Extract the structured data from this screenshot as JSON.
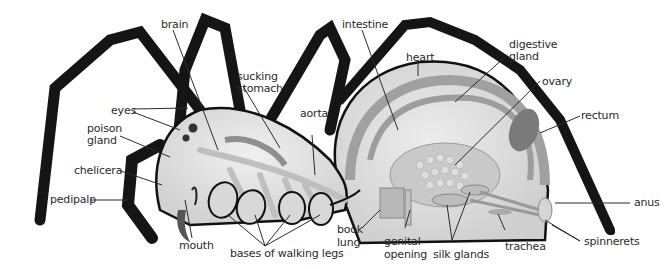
{
  "diagram": {
    "labels": {
      "brain": "brain",
      "sucking_1": "sucking",
      "sucking_2": "stomach",
      "intestine": "intestine",
      "heart": "heart",
      "digestive_1": "digestive",
      "digestive_2": "gland",
      "ovary": "ovary",
      "rectum": "rectum",
      "eyes": "eyes",
      "poison_1": "poison",
      "poison_2": "gland",
      "aorta": "aorta",
      "chelicera": "chelicera",
      "pedipalp": "pedipalp",
      "mouth": "mouth",
      "bases": "bases of  walking legs",
      "book_1": "book",
      "book_2": "lung",
      "genital_1": "genital",
      "genital_2": "opening",
      "silk": "silk  glands",
      "trachea": "trachea",
      "spinnerets": "spinnerets",
      "anus": "anus"
    },
    "colors": {
      "leg": "#1a1a1a",
      "body_fill": "#e4e4e4",
      "organ": "#a9a9a9",
      "organ_light": "#cfcfcf",
      "outline": "#111111",
      "leader": "#2a2a2a"
    }
  }
}
